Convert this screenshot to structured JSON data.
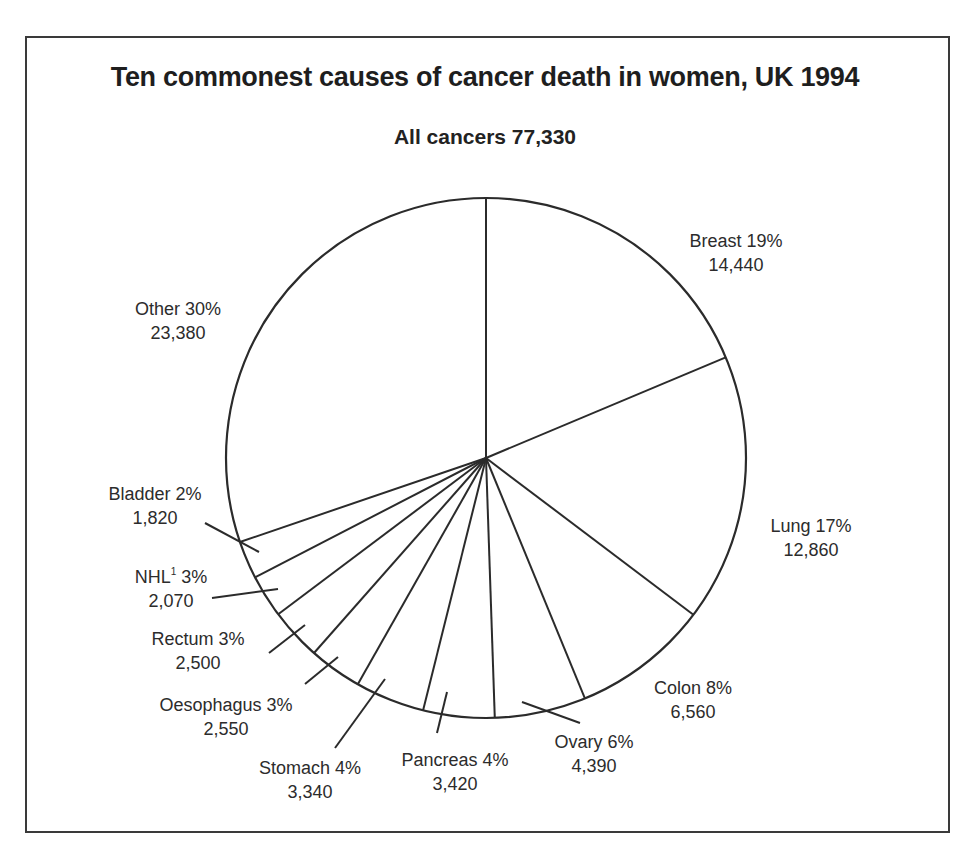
{
  "title": "Ten commonest causes of cancer death in women, UK 1994",
  "subtitle": "All cancers 77,330",
  "chart_data": {
    "type": "pie",
    "title": "Ten commonest causes of cancer death in women, UK 1994",
    "subtitle": "All cancers 77,330",
    "total": 77330,
    "slices": [
      {
        "name": "Breast",
        "percent": "19%",
        "value": 14440,
        "value_label": "14,440"
      },
      {
        "name": "Lung",
        "percent": "17%",
        "value": 12860,
        "value_label": "12,860"
      },
      {
        "name": "Colon",
        "percent": "8%",
        "value": 6560,
        "value_label": "6,560"
      },
      {
        "name": "Ovary",
        "percent": "6%",
        "value": 4390,
        "value_label": "4,390"
      },
      {
        "name": "Pancreas",
        "percent": "4%",
        "value": 3420,
        "value_label": "3,420"
      },
      {
        "name": "Stomach",
        "percent": "4%",
        "value": 3340,
        "value_label": "3,340"
      },
      {
        "name": "Oesophagus",
        "percent": "3%",
        "value": 2550,
        "value_label": "2,550"
      },
      {
        "name": "Rectum",
        "percent": "3%",
        "value": 2500,
        "value_label": "2,500"
      },
      {
        "name": "NHL",
        "superscript": "1",
        "percent": "3%",
        "value": 2070,
        "value_label": "2,070"
      },
      {
        "name": "Bladder",
        "percent": "2%",
        "value": 1820,
        "value_label": "1,820"
      },
      {
        "name": "Other",
        "percent": "30%",
        "value": 23380,
        "value_label": "23,380"
      }
    ],
    "start_angle": "12 o'clock",
    "direction": "clockwise",
    "fill": "none (white, outline only)"
  },
  "labels": {
    "breast": {
      "line1": "Breast 19%",
      "line2": "14,440"
    },
    "lung": {
      "line1": "Lung 17%",
      "line2": "12,860"
    },
    "colon": {
      "line1": "Colon 8%",
      "line2": "6,560"
    },
    "ovary": {
      "line1": "Ovary 6%",
      "line2": "4,390"
    },
    "pancreas": {
      "line1": "Pancreas 4%",
      "line2": "3,420"
    },
    "stomach": {
      "line1": "Stomach 4%",
      "line2": "3,340"
    },
    "oesophagus": {
      "line1": "Oesophagus 3%",
      "line2": "2,550"
    },
    "rectum": {
      "line1": "Rectum 3%",
      "line2": "2,500"
    },
    "nhl": {
      "name": "NHL",
      "sup": "1",
      "pct": " 3%",
      "line2": "2,070"
    },
    "bladder": {
      "line1": "Bladder 2%",
      "line2": "1,820"
    },
    "other": {
      "line1": "Other 30%",
      "line2": "23,380"
    }
  },
  "colors": {
    "stroke": "#2b2b2b",
    "text": "#2c2c2c",
    "background": "#ffffff"
  }
}
